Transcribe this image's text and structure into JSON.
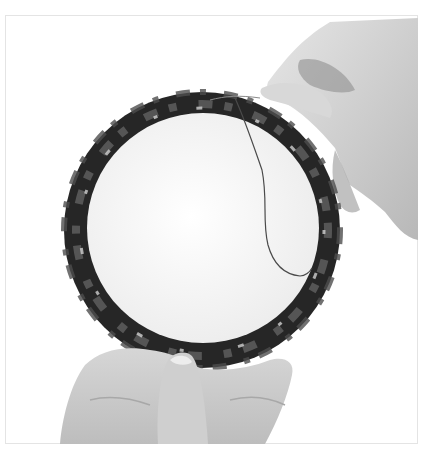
{
  "image": {
    "description": "Grayscale photo: two hands holding a fabric-wrapped embroidery-style ring with a white padded center; a thread runs from the top of the ring down the right side of the white center.",
    "palette": {
      "background": "#ffffff",
      "frame_border": "#e4e4e4",
      "ring_dark": "#1e1e1e",
      "ring_mid": "#5a5a5a",
      "center": "#f6f6f6",
      "skin_light": "#d9d9d9",
      "skin_shadow": "#9a9a9a",
      "thread": "#4a4a4a"
    }
  }
}
